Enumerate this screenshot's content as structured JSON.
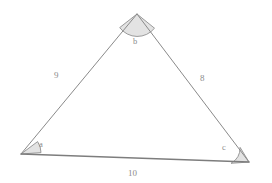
{
  "diagram": {
    "type": "triangle",
    "background_color": "#ffffff",
    "stroke_color": "#8a8a8a",
    "wedge_fill_color": "#e3e3e3",
    "wedge_stroke_color": "#909090",
    "text_color": "#8b8b8b",
    "vertices": [
      {
        "id": "A",
        "x": 21,
        "y": 154,
        "angle_label": "a"
      },
      {
        "id": "B",
        "x": 137,
        "y": 14,
        "angle_label": "b"
      },
      {
        "id": "C",
        "x": 249,
        "y": 162,
        "angle_label": "c"
      }
    ],
    "sides": [
      {
        "id": "AB",
        "from": "A",
        "to": "B",
        "label": "9",
        "label_x": 54,
        "label_y": 71
      },
      {
        "id": "BC",
        "from": "B",
        "to": "C",
        "label": "8",
        "label_x": 200,
        "label_y": 74
      },
      {
        "id": "CA",
        "from": "C",
        "to": "A",
        "label": "10",
        "label_x": 128,
        "label_y": 169
      }
    ],
    "angles": [
      {
        "id": "a",
        "label": "a",
        "vertex": "A",
        "label_x": 39,
        "label_y": 140,
        "arc_radius": 20
      },
      {
        "id": "b",
        "label": "b",
        "vertex": "B",
        "label_x": 133,
        "label_y": 37,
        "arc_radius": 22
      },
      {
        "id": "c",
        "label": "c",
        "vertex": "C",
        "label_x": 222,
        "label_y": 143,
        "arc_radius": 18
      }
    ],
    "side_labels": {
      "left": "9",
      "right": "8",
      "base": "10"
    },
    "angle_labels": {
      "left": "a",
      "top": "b",
      "right": "c"
    }
  }
}
